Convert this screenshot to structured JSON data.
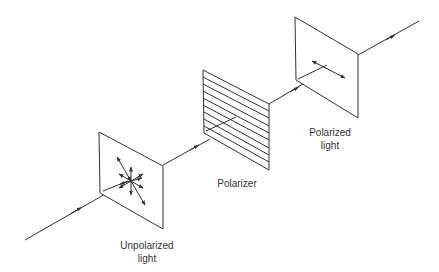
{
  "diagram": {
    "labels": {
      "unpolarized_line1": "Unpolarized",
      "unpolarized_line2": "light",
      "polarizer": "Polarizer",
      "polarized_line1": "Polarized",
      "polarized_line2": "light"
    },
    "colors": {
      "stroke": "#333333",
      "text": "#333333",
      "background": "#ffffff"
    }
  }
}
